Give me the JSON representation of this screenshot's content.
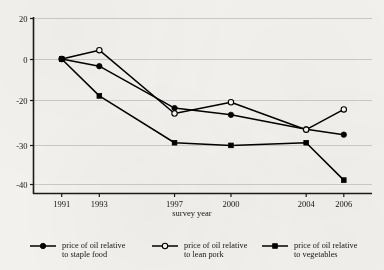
{
  "chart_data": {
    "type": "line",
    "title": "",
    "xlabel": "survey year",
    "ylabel": "",
    "x": [
      1991,
      1993,
      1997,
      2000,
      2004,
      2006
    ],
    "categories": [
      "1991",
      "1993",
      "1997",
      "2000",
      "2004",
      "2006"
    ],
    "xlim": [
      1989.5,
      2007.5
    ],
    "ylim": [
      -40,
      20
    ],
    "x_ticks": [
      "1991",
      "1993",
      "1997",
      "2000",
      "2004",
      "2006"
    ],
    "y_ticks": [
      "20",
      "0",
      "-20",
      "-30",
      "-40"
    ],
    "y_tick_values": [
      20,
      0,
      -20,
      -30,
      -40
    ],
    "grid": "horizontal",
    "legend_position": "bottom",
    "series": [
      {
        "name": "price of oil relative to staple food",
        "label_line1": "price of oil relative",
        "label_line2": "to staple food",
        "marker": "filled-circle",
        "color": "#000000",
        "values": [
          0,
          -3.5,
          -21.8,
          -23.3,
          -26.5,
          -27.7
        ]
      },
      {
        "name": "price of oil relative to lean pork",
        "label_line1": "price of oil relative",
        "label_line2": "to lean pork",
        "marker": "open-circle",
        "color": "#000000",
        "values": [
          0,
          4.3,
          -23.0,
          -20.5,
          -26.6,
          -22.1
        ]
      },
      {
        "name": "price of oil relative to vegetables",
        "label_line1": "price of oil relative",
        "label_line2": "to vegetables",
        "marker": "filled-square",
        "color": "#000000",
        "values": [
          0,
          -18.0,
          -29.5,
          -30.1,
          -29.5,
          -39.0
        ]
      }
    ]
  }
}
